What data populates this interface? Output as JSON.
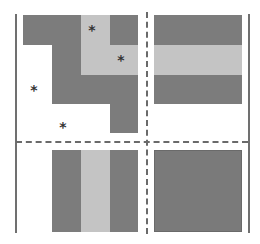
{
  "colors": {
    "dark": "#7c7c7c",
    "light": "#c4c4c4",
    "line": "#707070",
    "dash": "#6a6a6a",
    "star": "#333333",
    "background": "#ffffff"
  },
  "diagram": {
    "star_symbol": "*",
    "panels": {
      "top_left": "L-shaped staircase pattern of dark and light blocks with asterisk markers",
      "top_right": "Dark square with horizontal light band",
      "bottom_left": "Dark square with vertical light band",
      "bottom_right": "Solid dark square"
    },
    "stars": [
      {
        "x": 92,
        "y": 29
      },
      {
        "x": 121,
        "y": 59
      },
      {
        "x": 34,
        "y": 89
      },
      {
        "x": 63,
        "y": 126
      }
    ]
  }
}
